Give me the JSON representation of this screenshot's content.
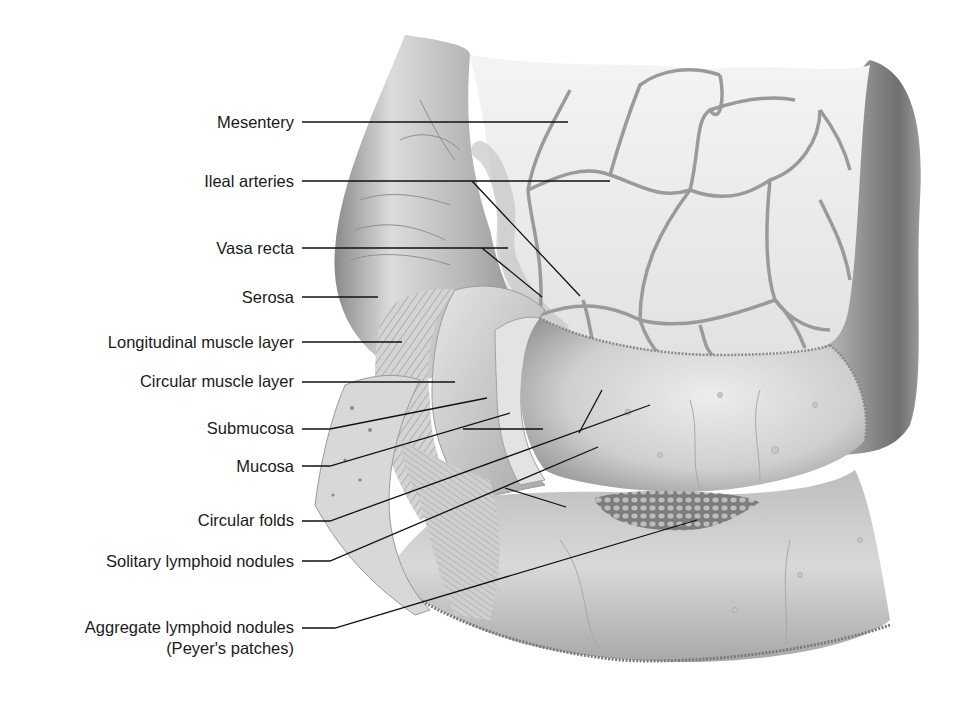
{
  "figure": {
    "labels": [
      {
        "id": "mesentery",
        "text": "Mesentery",
        "y": 122
      },
      {
        "id": "ileal-arteries",
        "text": "Ileal arteries",
        "y": 181
      },
      {
        "id": "vasa-recta",
        "text": "Vasa recta",
        "y": 248
      },
      {
        "id": "serosa",
        "text": "Serosa",
        "y": 297
      },
      {
        "id": "longitudinal-muscle-layer",
        "text": "Longitudinal muscle layer",
        "y": 342
      },
      {
        "id": "circular-muscle-layer",
        "text": "Circular muscle layer",
        "y": 381
      },
      {
        "id": "submucosa",
        "text": "Submucosa",
        "y": 428
      },
      {
        "id": "mucosa",
        "text": "Mucosa",
        "y": 466
      },
      {
        "id": "circular-folds",
        "text": "Circular folds",
        "y": 520
      },
      {
        "id": "solitary-lymphoid-nodules",
        "text": "Solitary lymphoid nodules",
        "y": 561
      },
      {
        "id": "aggregate-lymphoid-nodules",
        "text": "Aggregate lymphoid nodules",
        "subtext": "(Peyer's patches)",
        "y": 627
      }
    ]
  }
}
